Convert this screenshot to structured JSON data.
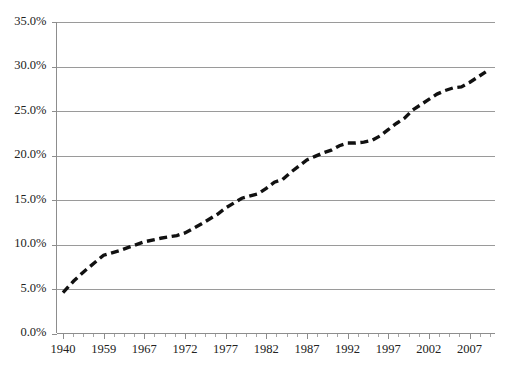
{
  "chart_data": {
    "type": "line",
    "title": "",
    "subtitle": "",
    "xlabel": "",
    "ylabel": "",
    "grid": true,
    "legend": false,
    "legend_position": "none",
    "ylim": [
      0,
      35
    ],
    "ytick_labels": [
      "0.0%",
      "5.0%",
      "10.0%",
      "15.0%",
      "20.0%",
      "25.0%",
      "30.0%",
      "35.0%"
    ],
    "ytick_values": [
      0,
      5,
      10,
      15,
      20,
      25,
      30,
      35
    ],
    "xtick_labels": [
      "1940",
      "1959",
      "1967",
      "1972",
      "1977",
      "1982",
      "1987",
      "1992",
      "1997",
      "2002",
      "2007"
    ],
    "series": [
      {
        "name": "value",
        "style": "dashed",
        "color": "#111111",
        "x": [
          1940,
          1945,
          1950,
          1955,
          1959,
          1962,
          1964,
          1967,
          1969,
          1971,
          1972,
          1974,
          1976,
          1977,
          1979,
          1981,
          1982,
          1983,
          1984,
          1985,
          1986,
          1987,
          1988,
          1989,
          1990,
          1991,
          1992,
          1993,
          1994,
          1995,
          1996,
          1997,
          1998,
          1999,
          2000,
          2001,
          2002,
          2003,
          2004,
          2005,
          2006,
          2007,
          2008,
          2009
        ],
        "values": [
          4.6,
          5.9,
          7.0,
          8.0,
          8.8,
          9.3,
          9.7,
          10.3,
          10.7,
          11.0,
          11.3,
          12.3,
          13.4,
          14.1,
          15.2,
          15.7,
          16.3,
          17.0,
          17.3,
          18.1,
          18.8,
          19.5,
          19.9,
          20.3,
          20.6,
          21.1,
          21.4,
          21.4,
          21.5,
          21.7,
          22.2,
          22.9,
          23.6,
          24.2,
          25.1,
          25.7,
          26.3,
          26.9,
          27.3,
          27.6,
          27.7,
          28.2,
          28.8,
          29.4
        ]
      }
    ]
  }
}
